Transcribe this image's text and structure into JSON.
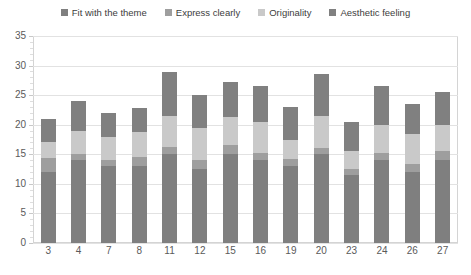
{
  "chart_data": {
    "type": "bar",
    "stacked": true,
    "title": "",
    "xlabel": "",
    "ylabel": "",
    "ylim": [
      0,
      35
    ],
    "ytick_step": 5,
    "yticks": [
      0,
      5,
      10,
      15,
      20,
      25,
      30,
      35
    ],
    "grid": true,
    "legend_position": "top",
    "categories": [
      "3",
      "4",
      "7",
      "8",
      "11",
      "12",
      "15",
      "16",
      "19",
      "20",
      "23",
      "24",
      "26",
      "27"
    ],
    "series": [
      {
        "name": "Fit with the theme",
        "color": "#7f7f7f",
        "values": [
          12.0,
          14.0,
          13.0,
          13.0,
          15.0,
          12.5,
          15.0,
          14.0,
          13.0,
          15.0,
          11.5,
          14.0,
          12.0,
          14.0
        ]
      },
      {
        "name": "Express clearly",
        "color": "#9e9e9e",
        "values": [
          2.3,
          1.0,
          1.0,
          1.5,
          1.2,
          1.5,
          1.5,
          1.3,
          1.2,
          1.0,
          1.0,
          1.2,
          1.3,
          1.5
        ]
      },
      {
        "name": "Originality",
        "color": "#c9c9c9",
        "values": [
          2.7,
          4.0,
          4.0,
          4.3,
          5.3,
          5.5,
          4.8,
          5.2,
          3.3,
          5.5,
          3.0,
          4.8,
          5.2,
          4.5
        ]
      },
      {
        "name": "Aesthetic feeling",
        "color": "#808080",
        "values": [
          4.0,
          5.0,
          4.0,
          4.0,
          7.5,
          5.5,
          6.0,
          6.0,
          5.5,
          7.0,
          5.0,
          6.5,
          5.0,
          5.5
        ]
      }
    ],
    "totals": [
      21.0,
      24.0,
      22.0,
      22.8,
      29.0,
      25.0,
      27.3,
      26.5,
      23.0,
      28.5,
      20.5,
      26.5,
      23.5,
      25.5
    ]
  },
  "legend": {
    "items": [
      {
        "label": "Fit with the theme",
        "color": "#7f7f7f"
      },
      {
        "label": "Express clearly",
        "color": "#9e9e9e"
      },
      {
        "label": "Originality",
        "color": "#c9c9c9"
      },
      {
        "label": "Aesthetic feeling",
        "color": "#808080"
      }
    ]
  },
  "axis": {
    "y_labels": [
      "35",
      "30",
      "25",
      "20",
      "15",
      "10",
      "5",
      "0"
    ],
    "x_labels": [
      "3",
      "4",
      "7",
      "8",
      "11",
      "12",
      "15",
      "16",
      "19",
      "20",
      "23",
      "24",
      "26",
      "27"
    ]
  },
  "colors": {
    "plot_background": "#ffffff",
    "gridline": "#e2e2e2",
    "axis_text": "#5a5a5a",
    "legend_text": "#3d3d3d",
    "frame": "#d4d4d4"
  }
}
